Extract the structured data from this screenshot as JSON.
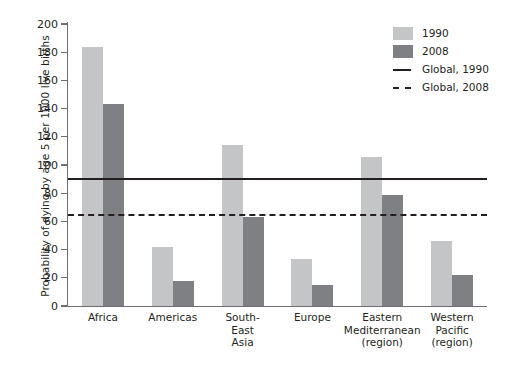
{
  "chart_data": {
    "type": "bar",
    "title": "",
    "subtitle": "",
    "xlabel": "",
    "ylabel": "Probability of dying by age 5 per 1000 live births",
    "ylim": [
      0,
      200
    ],
    "yticks": [
      0,
      20,
      40,
      60,
      80,
      100,
      120,
      140,
      160,
      180,
      200
    ],
    "ytick_labels": [
      "0",
      "20",
      "40",
      "60",
      "80",
      "100",
      "120",
      "140",
      "160",
      "180",
      "200"
    ],
    "grid": false,
    "legend_position": "top-right",
    "categories": [
      "Africa",
      "Americas",
      "South-East Asia",
      "Europe",
      "Eastern Mediterranean (region)",
      "Western Pacific (region)"
    ],
    "category_label_lines": [
      [
        "Africa"
      ],
      [
        "Americas"
      ],
      [
        "South-",
        "East",
        "Asia"
      ],
      [
        "Europe"
      ],
      [
        "Eastern",
        "Mediterranean",
        "(region)"
      ],
      [
        "Western",
        "Pacific",
        "(region)"
      ]
    ],
    "series": [
      {
        "name": "1990",
        "color": "#c4c5c7",
        "values": [
          184,
          42,
          114,
          33,
          106,
          46
        ]
      },
      {
        "name": "2008",
        "color": "#7f8083",
        "values": [
          143,
          18,
          63,
          15,
          79,
          22
        ]
      }
    ],
    "reference_lines": [
      {
        "name": "Global, 1990",
        "value": 91,
        "style": "solid",
        "color": "#231f20"
      },
      {
        "name": "Global, 2008",
        "value": 65,
        "style": "dashed",
        "color": "#231f20"
      }
    ]
  },
  "legend": {
    "items": [
      {
        "label": "1990",
        "key": "swatch-light"
      },
      {
        "label": "2008",
        "key": "swatch-dark"
      },
      {
        "label": "Global, 1990",
        "key": "line-solid"
      },
      {
        "label": "Global, 2008",
        "key": "line-dashed"
      }
    ]
  },
  "colors": {
    "series_1990": "#c4c5c7",
    "series_2008": "#7f8083",
    "axis": "#6d6e71",
    "text": "#231f20",
    "background": "#ffffff"
  }
}
